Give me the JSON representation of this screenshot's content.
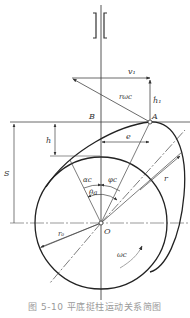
{
  "figure": {
    "caption": "图 5-10   平底挺柱运动关系简图",
    "labels": {
      "v1": "v₁",
      "r_omega": "rωc",
      "h_dot": "ḣ₁",
      "B": "B",
      "A": "A",
      "h": "h",
      "S": "S",
      "e": "e",
      "alpha": "αc",
      "phi": "φc",
      "theta": "θa",
      "r": "r",
      "r0": "r₀",
      "O": "O",
      "omega": "ωc"
    },
    "colors": {
      "line": "#333333",
      "thin": "#555555",
      "caption": "#9a9a9a"
    }
  }
}
